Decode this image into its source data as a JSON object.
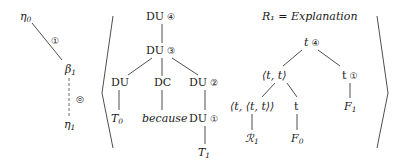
{
  "left_chain": {
    "top_node": "η",
    "top_sub": "0",
    "edge_label": "①",
    "mid_node": "β",
    "mid_sub": "1",
    "dashed_edge_label": "◎",
    "bottom_node": "η",
    "bottom_sub": "1"
  },
  "du_tree": {
    "root": {
      "label": "DU",
      "mark": "④"
    },
    "level1": {
      "label": "DU",
      "mark": "③"
    },
    "children": [
      {
        "label": "DU",
        "mark": "",
        "leaf": "T",
        "leaf_sub": "0"
      },
      {
        "label": "DC",
        "mark": "",
        "leaf": "because"
      },
      {
        "label": "DU",
        "mark": "②",
        "child": {
          "label": "DU",
          "mark": "①"
        },
        "leaf": "T",
        "leaf_sub": "1"
      }
    ]
  },
  "type_tree": {
    "title": "R₁ = Explanation",
    "root": {
      "label": "t",
      "mark": "④"
    },
    "left": {
      "label": "⟨t, t⟩"
    },
    "right": {
      "label": "t",
      "mark": "①",
      "leaf": "F",
      "leaf_sub": "1"
    },
    "left_left": {
      "label": "⟨t, ⟨t, t⟩⟩",
      "leaf": "ℛ",
      "leaf_sub": "1"
    },
    "left_right": {
      "label": "t",
      "leaf": "F",
      "leaf_sub": "0"
    }
  }
}
